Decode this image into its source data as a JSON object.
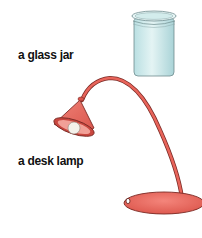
{
  "items": [
    {
      "label": "a glass jar",
      "icon": "glass-jar-icon"
    },
    {
      "label": "a desk lamp",
      "icon": "desk-lamp-icon"
    }
  ],
  "colors": {
    "jar_fill": "#cfe9ea",
    "jar_outline": "#6f8c8e",
    "lamp_fill": "#e8645a",
    "lamp_dark": "#b8403a",
    "lamp_outline": "#7a2a25",
    "bulb": "#f4f1ea",
    "text": "#111111"
  }
}
